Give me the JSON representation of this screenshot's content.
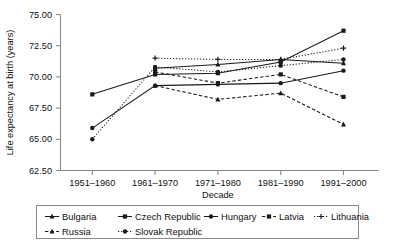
{
  "chart_data": {
    "type": "line",
    "title": "",
    "xlabel": "Decade",
    "ylabel": "Life expectancy at birth (years)",
    "categories": [
      "1951–1960",
      "1961–1970",
      "1971–1980",
      "1981–1990",
      "1991–2000"
    ],
    "ylim": [
      62.5,
      75.0
    ],
    "yticks": [
      "62.50",
      "65.00",
      "67.50",
      "70.00",
      "72.50",
      "75.00"
    ],
    "ytick_values": [
      62.5,
      65.0,
      67.5,
      70.0,
      72.5,
      75.0
    ],
    "grid": false,
    "legend_position": "bottom",
    "series": [
      {
        "name": "Bulgaria",
        "marker": "triangle-up",
        "dash": "solid",
        "values": [
          null,
          70.7,
          71.0,
          71.4,
          71.1
        ]
      },
      {
        "name": "Czech Republic",
        "marker": "square",
        "dash": "solid",
        "values": [
          68.6,
          70.2,
          70.3,
          71.2,
          73.7
        ]
      },
      {
        "name": "Hungary",
        "marker": "circle",
        "dash": "solid",
        "values": [
          65.9,
          69.3,
          69.4,
          69.5,
          70.5
        ]
      },
      {
        "name": "Latvia",
        "marker": "square",
        "dash": "dashed",
        "values": [
          null,
          70.4,
          69.5,
          70.2,
          68.4
        ]
      },
      {
        "name": "Lithuania",
        "marker": "plus",
        "dash": "dotted",
        "values": [
          null,
          71.5,
          71.4,
          71.4,
          72.3
        ]
      },
      {
        "name": "Russia",
        "marker": "triangle-up",
        "dash": "dashed",
        "values": [
          null,
          69.3,
          68.2,
          68.7,
          66.2
        ]
      },
      {
        "name": "Slovak Republic",
        "marker": "circle",
        "dash": "dotted",
        "values": [
          65.0,
          70.8,
          70.4,
          70.9,
          71.4
        ]
      }
    ]
  },
  "axis": {
    "y_title": "Life expectancy at birth (years)",
    "x_title": "Decade",
    "ytick_0": "62.50",
    "ytick_1": "65.00",
    "ytick_2": "67.50",
    "ytick_3": "70.00",
    "ytick_4": "72.50",
    "ytick_5": "75.00",
    "xtick_0": "1951–1960",
    "xtick_1": "1961–1970",
    "xtick_2": "1971–1980",
    "xtick_3": "1981–1990",
    "xtick_4": "1991–2000"
  },
  "legend": {
    "items": [
      {
        "label": "Bulgaria"
      },
      {
        "label": "Czech Republic"
      },
      {
        "label": "Hungary"
      },
      {
        "label": "Latvia"
      },
      {
        "label": "Lithuania"
      },
      {
        "label": "Russia"
      },
      {
        "label": "Slovak Republic"
      }
    ]
  },
  "colors": {
    "ink": "#1a1a1a",
    "axis": "#8a8a8a",
    "background": "#ffffff"
  }
}
